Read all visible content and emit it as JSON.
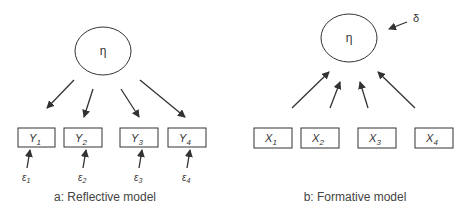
{
  "reflective": {
    "caption": "a: Reflective model",
    "latent": "η",
    "indicators": [
      {
        "name": "Y",
        "sub": "1",
        "error": "ε",
        "error_sub": "1"
      },
      {
        "name": "Y",
        "sub": "2",
        "error": "ε",
        "error_sub": "2"
      },
      {
        "name": "Y",
        "sub": "3",
        "error": "ε",
        "error_sub": "3"
      },
      {
        "name": "Y",
        "sub": "4",
        "error": "ε",
        "error_sub": "4"
      }
    ]
  },
  "formative": {
    "caption": "b: Formative model",
    "latent": "η",
    "disturbance": "δ",
    "indicators": [
      {
        "name": "X",
        "sub": "1"
      },
      {
        "name": "X",
        "sub": "2"
      },
      {
        "name": "X",
        "sub": "3"
      },
      {
        "name": "X",
        "sub": "4"
      }
    ]
  },
  "colors": {
    "stroke": "#333333",
    "text": "#333333",
    "background": "#ffffff"
  }
}
